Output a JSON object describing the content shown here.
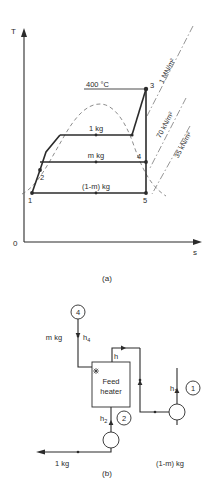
{
  "figure": {
    "panel_a": {
      "caption": "(a)",
      "axis": {
        "y_label": "T",
        "x_label": "s",
        "origin_label": "0"
      },
      "temperature_label": "400 °C",
      "pressure_lines": [
        {
          "id": "p-high",
          "label": "1 MN/m²"
        },
        {
          "id": "p-mid",
          "label": "70 kN/m²"
        },
        {
          "id": "p-low",
          "label": "35 kN/m²"
        }
      ],
      "mass_labels": [
        {
          "id": "mass-1kg",
          "label": "1 kg"
        },
        {
          "id": "mass-mkg",
          "label": "m kg"
        },
        {
          "id": "mass-1mkg",
          "label": "(1-m) kg"
        }
      ],
      "state_points": [
        {
          "id": "state-1",
          "label": "1"
        },
        {
          "id": "state-2",
          "label": "2"
        },
        {
          "id": "state-3",
          "label": "3"
        },
        {
          "id": "state-4",
          "label": "4"
        },
        {
          "id": "state-5",
          "label": "5"
        }
      ]
    },
    "panel_b": {
      "caption": "(b)",
      "component": {
        "line1": "Feed",
        "line2": "heater"
      },
      "nodes": [
        {
          "id": "node-4",
          "label": "4"
        },
        {
          "id": "node-2",
          "label": "2"
        },
        {
          "id": "node-1",
          "label": "1"
        }
      ],
      "enthalpies": [
        {
          "id": "h4",
          "base": "h",
          "sub": "4"
        },
        {
          "id": "h2",
          "base": "h",
          "sub": "2"
        },
        {
          "id": "h1",
          "base": "h",
          "sub": "1"
        },
        {
          "id": "hx",
          "base": "h",
          "sub": ""
        }
      ],
      "flow_labels": [
        {
          "id": "flow-mkg",
          "label": "m kg"
        },
        {
          "id": "flow-1kg",
          "label": "1 kg"
        },
        {
          "id": "flow-1mkg",
          "label": "(1-m) kg"
        }
      ]
    }
  },
  "colors": {
    "ink": "#2b2b2b",
    "dash": "#6f6f6f",
    "dashdot": "#7a7a7a",
    "paper": "#ffffff"
  }
}
